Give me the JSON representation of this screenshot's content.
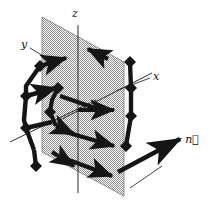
{
  "figure": {
    "background_color": "#ffffff",
    "ink_color": "#151515",
    "plane_fill_color": "#a9a9a9",
    "plane_edge_color": "#6f6f6f",
    "axis_line_color": "#2a2a2a"
  },
  "labels": {
    "z_axis": "z",
    "y_axis": "y",
    "x_axis": "x",
    "normal_vector": "n⃗"
  },
  "axes": [
    {
      "name": "z",
      "label": "z",
      "from": [
        78,
        110
      ],
      "to": [
        78,
        25
      ],
      "label_pos": [
        75,
        16
      ]
    },
    {
      "name": "y",
      "label": "y",
      "from": [
        78,
        110
      ],
      "to": [
        12,
        140
      ],
      "label_pos": [
        22,
        45
      ]
    },
    {
      "name": "x",
      "label": "x",
      "from": [
        78,
        110
      ],
      "to": [
        150,
        72
      ],
      "label_pos": [
        156,
        79
      ]
    }
  ],
  "plane": {
    "name": "shaded-plane",
    "points": [
      [
        42,
        17
      ],
      [
        124,
        62
      ],
      [
        124,
        196
      ],
      [
        42,
        152
      ]
    ]
  },
  "normal": {
    "name": "normal-vector-arrow",
    "from": [
      118,
      172
    ],
    "to": [
      186,
      136
    ],
    "label": "n⃗",
    "label_pos": [
      190,
      140
    ]
  },
  "plane_vectors": [
    {
      "name": "plane-arrow-right-1",
      "from": [
        78,
        110
      ],
      "to": [
        120,
        110
      ]
    },
    {
      "name": "plane-arrow-right-2",
      "from": [
        62,
        130
      ],
      "to": [
        121,
        145
      ]
    },
    {
      "name": "plane-arrow-right-3",
      "from": [
        58,
        155
      ],
      "to": [
        119,
        176
      ]
    },
    {
      "name": "plane-arrow-up-left-top",
      "from": [
        106,
        58
      ],
      "to": [
        85,
        48
      ]
    }
  ],
  "left_chain": {
    "name": "left-vector-chain",
    "nodes": [
      [
        40,
        66
      ],
      [
        25,
        96
      ],
      [
        25,
        126
      ],
      [
        32,
        152
      ]
    ],
    "joints": [
      [
        40,
        66
      ],
      [
        25,
        96
      ],
      [
        25,
        126
      ],
      [
        32,
        152
      ]
    ]
  },
  "right_chain": {
    "name": "right-vector-chain",
    "nodes": [
      [
        130,
        62
      ],
      [
        131,
        90
      ],
      [
        131,
        118
      ],
      [
        126,
        148
      ]
    ],
    "joints": [
      [
        130,
        62
      ],
      [
        131,
        90
      ],
      [
        131,
        118
      ],
      [
        126,
        148
      ]
    ]
  },
  "connector_arrows": [
    {
      "name": "connector-arrow-a",
      "from": [
        40,
        66
      ],
      "to": [
        62,
        60
      ]
    },
    {
      "name": "connector-arrow-b",
      "from": [
        40,
        100
      ],
      "to": [
        66,
        92
      ]
    },
    {
      "name": "connector-arrow-c",
      "from": [
        36,
        124
      ],
      "to": [
        62,
        128
      ]
    },
    {
      "name": "connector-arrow-d",
      "from": [
        52,
        152
      ],
      "to": [
        72,
        165
      ]
    }
  ],
  "accents": {
    "joint_size": 7,
    "stroke_width_thick": 4.2,
    "stroke_width_axis": 1.0,
    "arrow_head_length": 8
  }
}
